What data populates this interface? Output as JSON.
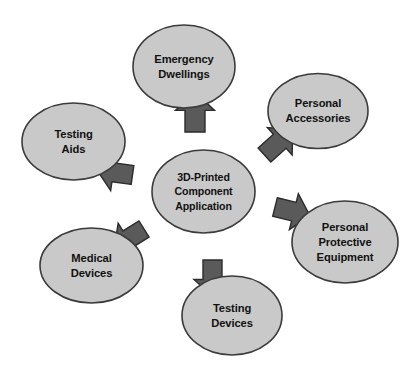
{
  "diagram": {
    "type": "hub-and-spoke",
    "background_color": "#ffffff",
    "node_fill_color": "#c9c9c9",
    "node_stroke_color": "#3b3b3b",
    "arrow_fill_color": "#5a5a5a",
    "arrow_stroke_color": "#2b2b2b",
    "text_color": "#111111",
    "center": {
      "id": "center-node",
      "name": "3d-printed-component-application",
      "lines": [
        "3D-Printed",
        "Component",
        "Application"
      ],
      "cx": 203.5,
      "cy": 191.5,
      "rx": 51.5,
      "ry": 41.5
    },
    "nodes": [
      {
        "id": "node-emergency-dwellings",
        "name": "emergency-dwellings",
        "lines": [
          "Emergency",
          "Dwellings"
        ],
        "cx": 184.0,
        "cy": 66.5,
        "rx": 51.0,
        "ry": 41.5,
        "direction": "up"
      },
      {
        "id": "node-personal-accessories",
        "name": "personal-accessories",
        "lines": [
          "Personal",
          "Accessories"
        ],
        "cx": 318.0,
        "cy": 111.0,
        "rx": 50.0,
        "ry": 37.5,
        "direction": "up-right"
      },
      {
        "id": "node-personal-protective-equipment",
        "name": "personal-protective-equipment",
        "lines": [
          "Personal",
          "Protective",
          "Equipment"
        ],
        "cx": 345.0,
        "cy": 242.0,
        "rx": 53.0,
        "ry": 41.0,
        "direction": "right"
      },
      {
        "id": "node-testing-devices",
        "name": "testing-devices",
        "lines": [
          "Testing",
          "Devices"
        ],
        "cx": 232.0,
        "cy": 315.5,
        "rx": 50.0,
        "ry": 39.5,
        "direction": "down"
      },
      {
        "id": "node-medical-devices",
        "name": "medical-devices",
        "lines": [
          "Medical",
          "Devices"
        ],
        "cx": 91.5,
        "cy": 265.5,
        "rx": 51.5,
        "ry": 37.5,
        "direction": "down-left"
      },
      {
        "id": "node-testing-aids",
        "name": "testing-aids",
        "lines": [
          "Testing",
          "Aids"
        ],
        "cx": 73.5,
        "cy": 141.5,
        "rx": 51.5,
        "ry": 38.5,
        "direction": "left"
      }
    ],
    "arrows": [
      {
        "id": "arrow-up",
        "name": "arrow-to-emergency-dwellings",
        "target": "node-emergency-dwellings",
        "x": 195.0,
        "y": 132.0,
        "angle": -90,
        "length": 40,
        "width": 20
      },
      {
        "id": "arrow-up-right",
        "name": "arrow-to-personal-accessories",
        "target": "node-personal-accessories",
        "x": 264.5,
        "y": 155.0,
        "angle": -42,
        "length": 38,
        "width": 19
      },
      {
        "id": "arrow-right",
        "name": "arrow-to-personal-protective-equipment",
        "target": "node-personal-protective-equipment",
        "x": 275.0,
        "y": 207.0,
        "angle": 14,
        "length": 36,
        "width": 19
      },
      {
        "id": "arrow-down",
        "name": "arrow-to-testing-devices",
        "target": "node-testing-devices",
        "x": 212.5,
        "y": 260.0,
        "angle": 90,
        "length": 36,
        "width": 19
      },
      {
        "id": "arrow-down-left",
        "name": "arrow-to-medical-devices",
        "target": "node-medical-devices",
        "x": 144.0,
        "y": 229.0,
        "angle": 148,
        "length": 35,
        "width": 19
      },
      {
        "id": "arrow-left",
        "name": "arrow-to-testing-aids",
        "target": "node-testing-aids",
        "x": 132.5,
        "y": 175.0,
        "angle": 188,
        "length": 36,
        "width": 19
      }
    ]
  }
}
